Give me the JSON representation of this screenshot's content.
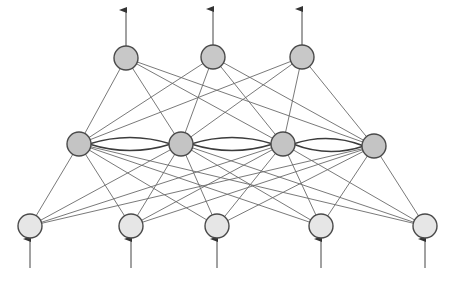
{
  "diagram": {
    "type": "recurrent-neural-network",
    "colors": {
      "background": "#ffffff",
      "edge": "#6a6a6a",
      "lateral_edge": "#3c3c3c",
      "node_stroke": "#4a4a4a",
      "input_fill": "#e6e6e6",
      "hidden_fill": "#c4c4c4",
      "output_fill": "#c8c8c8",
      "arrow": "#444444"
    },
    "node_radius": 12,
    "layers": {
      "output": [
        {
          "x": 126,
          "y": 58
        },
        {
          "x": 213,
          "y": 57
        },
        {
          "x": 302,
          "y": 57
        }
      ],
      "hidden": [
        {
          "x": 79,
          "y": 144
        },
        {
          "x": 181,
          "y": 144
        },
        {
          "x": 283,
          "y": 144
        },
        {
          "x": 374,
          "y": 146
        }
      ],
      "input": [
        {
          "x": 30,
          "y": 226
        },
        {
          "x": 131,
          "y": 226
        },
        {
          "x": 217,
          "y": 226
        },
        {
          "x": 321,
          "y": 226
        },
        {
          "x": 425,
          "y": 226
        }
      ]
    },
    "connections": {
      "input_to_hidden": "full",
      "hidden_to_output": "full",
      "hidden_lateral": "adjacent-bidirectional"
    },
    "output_arrows": {
      "length": 36
    },
    "input_arrows": {
      "start_y": 268
    }
  }
}
